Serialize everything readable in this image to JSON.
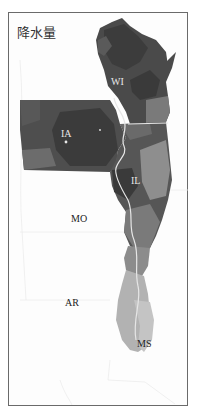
{
  "map": {
    "title": "降水量",
    "type": "grayscale choropleth",
    "colors": {
      "frame": "#6a6a6a",
      "background": "#ffffff",
      "darkest": "#3a3a3a",
      "dark": "#4d4d4d",
      "medium": "#6e6e6e",
      "light": "#939393",
      "lighter": "#b4b4b4",
      "lightest": "#c8c8c8",
      "boundary": "#e6e6e6"
    },
    "state_labels": [
      {
        "id": "WI",
        "text": "WI"
      },
      {
        "id": "IA",
        "text": "IA"
      },
      {
        "id": "IL",
        "text": "IL"
      },
      {
        "id": "MO",
        "text": "MO"
      },
      {
        "id": "AR",
        "text": "AR"
      },
      {
        "id": "MS",
        "text": "MS"
      }
    ]
  }
}
